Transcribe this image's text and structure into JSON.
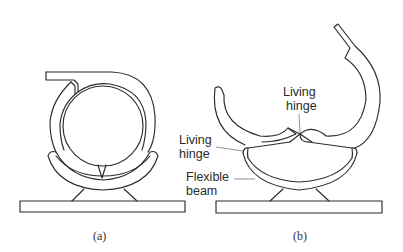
{
  "figure": {
    "panels": [
      {
        "id": "a",
        "caption": "(a)",
        "description": "Clip closed around a circular rod: C-shaped hooked arm on top, curved flexible beam cradle below, mounted on a flat base plate"
      },
      {
        "id": "b",
        "caption": "(b)",
        "description": "Clip open: two curved jaws joined at a central living hinge, supported by a flexible beam on a flat base plate; tall hooked arm on the right"
      }
    ],
    "labels": {
      "living_hinge_top": [
        "Living",
        "hinge"
      ],
      "living_hinge_side": [
        "Living",
        "hinge"
      ],
      "flexible_beam": [
        "Flexible",
        "beam"
      ]
    },
    "colors": {
      "line": "#2b2b2b",
      "leader": "#777777",
      "background": "#ffffff"
    }
  }
}
